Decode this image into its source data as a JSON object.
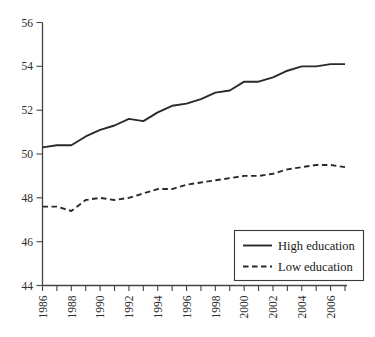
{
  "chart_data": {
    "type": "line",
    "title": "",
    "subtitle": "",
    "xlabel": "",
    "ylabel": "",
    "xlim": [
      1986,
      2007
    ],
    "ylim": [
      44,
      56
    ],
    "grid": false,
    "legend_position": "bottom-right",
    "x": [
      1986,
      1987,
      1988,
      1989,
      1990,
      1991,
      1992,
      1993,
      1994,
      1995,
      1996,
      1997,
      1998,
      1999,
      2000,
      2001,
      2002,
      2003,
      2004,
      2005,
      2006,
      2007
    ],
    "x_tick_labels": [
      "1986",
      "",
      "1988",
      "",
      "1990",
      "",
      "1992",
      "",
      "1994",
      "",
      "1996",
      "",
      "1998",
      "",
      "2000",
      "",
      "2002",
      "",
      "2004",
      "",
      "2006",
      ""
    ],
    "x_tick_labels_visible": [
      "1986",
      "1988",
      "1990",
      "1992",
      "1994",
      "1996",
      "1998",
      "2000",
      "2002",
      "2004",
      "2006"
    ],
    "y_tick_labels": [
      "44",
      "46",
      "48",
      "50",
      "52",
      "54",
      "56"
    ],
    "y_ticks": [
      44,
      46,
      48,
      50,
      52,
      54,
      56
    ],
    "series": [
      {
        "name": "High education",
        "style": "solid",
        "color": "#2a2a2a",
        "values": [
          50.3,
          50.4,
          50.4,
          50.8,
          51.1,
          51.3,
          51.6,
          51.5,
          51.9,
          52.2,
          52.3,
          52.5,
          52.8,
          52.9,
          53.3,
          53.3,
          53.5,
          53.8,
          54.0,
          54.0,
          54.1,
          54.1
        ]
      },
      {
        "name": "Low education",
        "style": "dashed",
        "color": "#2a2a2a",
        "values": [
          47.6,
          47.6,
          47.4,
          47.9,
          48.0,
          47.9,
          48.0,
          48.2,
          48.4,
          48.4,
          48.6,
          48.7,
          48.8,
          48.9,
          49.0,
          49.0,
          49.1,
          49.3,
          49.4,
          49.5,
          49.5,
          49.4
        ]
      }
    ],
    "legend": [
      {
        "label": "High education",
        "style": "solid"
      },
      {
        "label": "Low education",
        "style": "dashed"
      }
    ]
  }
}
